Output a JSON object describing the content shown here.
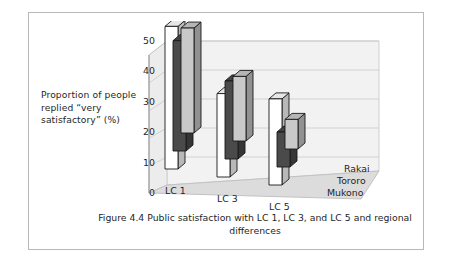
{
  "figure": {
    "axis_label": "Proportion of people replied “very satisfactory” (%)",
    "caption": "Figure 4.4 Public satisfaction with LC 1, LC 3, and LC 5 and regional differences"
  },
  "chart_data": {
    "type": "bar",
    "render": "3d-grouped-bar",
    "title": "Figure 4.4 Public satisfaction with LC 1, LC 3, and LC 5 and regional differences",
    "xlabel": "",
    "ylabel": "Proportion of people replied “very satisfactory” (%)",
    "categories": [
      "LC 1",
      "LC 3",
      "LC 5"
    ],
    "yticks": [
      50,
      40,
      30,
      20,
      10,
      0
    ],
    "ylim": [
      0,
      55
    ],
    "grid": true,
    "legend_position": "right-depth-axis",
    "series": [
      {
        "name": "Rakai",
        "values": [
          53,
          31,
          32
        ],
        "color": "#ffffff"
      },
      {
        "name": "Tororo",
        "values": [
          41,
          29,
          13
        ],
        "color": "#4a4a4a"
      },
      {
        "name": "Mukono",
        "values": [
          39,
          24,
          11
        ],
        "color": "#c9c9c9"
      }
    ]
  }
}
